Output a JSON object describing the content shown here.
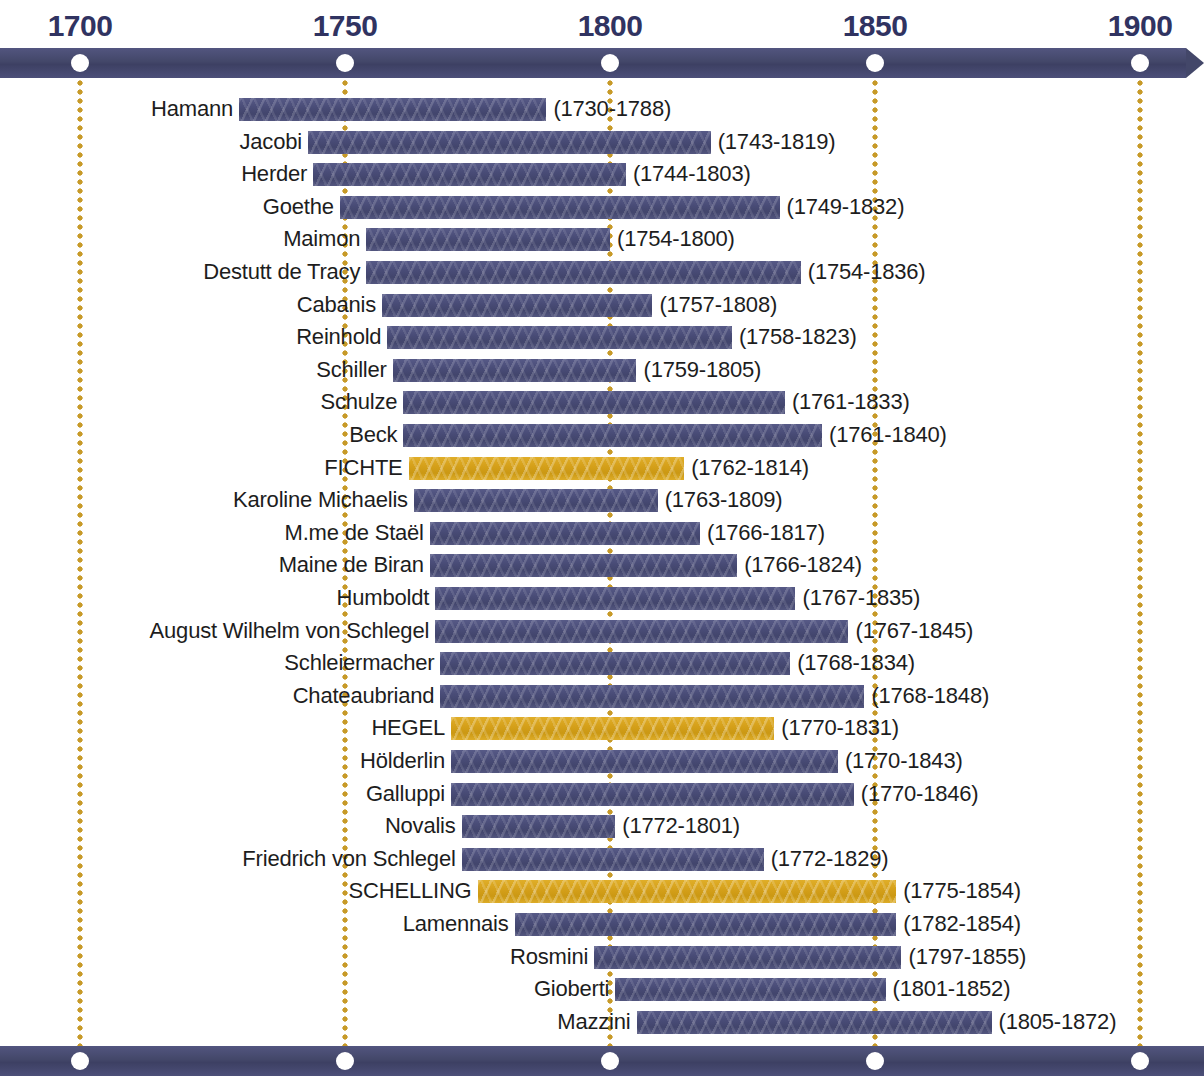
{
  "colors": {
    "bar_navy": "#4A4D78",
    "bar_highlight": "#D8A41E",
    "axis_navy": "#484B78",
    "guide_gold": "#C79A28",
    "year_label": "#303361",
    "text": "#1D1D1D",
    "background": "#FFFFFF"
  },
  "axis": {
    "ticks": [
      {
        "label": "1700",
        "year": 1700
      },
      {
        "label": "1750",
        "year": 1750
      },
      {
        "label": "1800",
        "year": 1800
      },
      {
        "label": "1850",
        "year": 1850
      },
      {
        "label": "1900",
        "year": 1900
      }
    ]
  },
  "chart_data": {
    "type": "bar",
    "title": "",
    "xlabel": "",
    "ylabel": "",
    "xlim": [
      1700,
      1900
    ],
    "grid": true,
    "legend": "none",
    "orientation": "horizontal-gantt",
    "categories": [
      "Hamann",
      "Jacobi",
      "Herder",
      "Goethe",
      "Maimon",
      "Destutt de Tracy",
      "Cabanis",
      "Reinhold",
      "Schiller",
      "Schulze",
      "Beck",
      "FICHTE",
      "Karoline Michaelis",
      "M.me de Staël",
      "Maine de Biran",
      "Humboldt",
      "August Wilhelm von Schlegel",
      "Schleiermacher",
      "Chateaubriand",
      "HEGEL",
      "Hölderlin",
      "Galluppi",
      "Novalis",
      "Friedrich von Schlegel",
      "SCHELLING",
      "Lamennais",
      "Rosmini",
      "Gioberti",
      "Mazzini"
    ],
    "rows": [
      {
        "name": "Hamann",
        "birth": 1730,
        "death": 1788,
        "dates": "(1730-1788)",
        "highlight": false
      },
      {
        "name": "Jacobi",
        "birth": 1743,
        "death": 1819,
        "dates": "(1743-1819)",
        "highlight": false
      },
      {
        "name": "Herder",
        "birth": 1744,
        "death": 1803,
        "dates": "(1744-1803)",
        "highlight": false
      },
      {
        "name": "Goethe",
        "birth": 1749,
        "death": 1832,
        "dates": "(1749-1832)",
        "highlight": false
      },
      {
        "name": "Maimon",
        "birth": 1754,
        "death": 1800,
        "dates": "(1754-1800)",
        "highlight": false
      },
      {
        "name": "Destutt de Tracy",
        "birth": 1754,
        "death": 1836,
        "dates": "(1754-1836)",
        "highlight": false
      },
      {
        "name": "Cabanis",
        "birth": 1757,
        "death": 1808,
        "dates": "(1757-1808)",
        "highlight": false
      },
      {
        "name": "Reinhold",
        "birth": 1758,
        "death": 1823,
        "dates": "(1758-1823)",
        "highlight": false
      },
      {
        "name": "Schiller",
        "birth": 1759,
        "death": 1805,
        "dates": "(1759-1805)",
        "highlight": false
      },
      {
        "name": "Schulze",
        "birth": 1761,
        "death": 1833,
        "dates": "(1761-1833)",
        "highlight": false
      },
      {
        "name": "Beck",
        "birth": 1761,
        "death": 1840,
        "dates": "(1761-1840)",
        "highlight": false
      },
      {
        "name": "FICHTE",
        "birth": 1762,
        "death": 1814,
        "dates": "(1762-1814)",
        "highlight": true
      },
      {
        "name": "Karoline Michaelis",
        "birth": 1763,
        "death": 1809,
        "dates": "(1763-1809)",
        "highlight": false
      },
      {
        "name": "M.me de Staël",
        "birth": 1766,
        "death": 1817,
        "dates": "(1766-1817)",
        "highlight": false
      },
      {
        "name": "Maine de Biran",
        "birth": 1766,
        "death": 1824,
        "dates": "(1766-1824)",
        "highlight": false
      },
      {
        "name": "Humboldt",
        "birth": 1767,
        "death": 1835,
        "dates": "(1767-1835)",
        "highlight": false
      },
      {
        "name": "August Wilhelm von Schlegel",
        "birth": 1767,
        "death": 1845,
        "dates": "(1767-1845)",
        "highlight": false
      },
      {
        "name": "Schleiermacher",
        "birth": 1768,
        "death": 1834,
        "dates": "(1768-1834)",
        "highlight": false
      },
      {
        "name": "Chateaubriand",
        "birth": 1768,
        "death": 1848,
        "dates": "(1768-1848)",
        "highlight": false
      },
      {
        "name": "HEGEL",
        "birth": 1770,
        "death": 1831,
        "dates": "(1770-1831)",
        "highlight": true
      },
      {
        "name": "Hölderlin",
        "birth": 1770,
        "death": 1843,
        "dates": "(1770-1843)",
        "highlight": false
      },
      {
        "name": "Galluppi",
        "birth": 1770,
        "death": 1846,
        "dates": "(1770-1846)",
        "highlight": false
      },
      {
        "name": "Novalis",
        "birth": 1772,
        "death": 1801,
        "dates": "(1772-1801)",
        "highlight": false
      },
      {
        "name": "Friedrich von Schlegel",
        "birth": 1772,
        "death": 1829,
        "dates": "(1772-1829)",
        "highlight": false
      },
      {
        "name": "SCHELLING",
        "birth": 1775,
        "death": 1854,
        "dates": "(1775-1854)",
        "highlight": true
      },
      {
        "name": "Lamennais",
        "birth": 1782,
        "death": 1854,
        "dates": "(1782-1854)",
        "highlight": false
      },
      {
        "name": "Rosmini",
        "birth": 1797,
        "death": 1855,
        "dates": "(1797-1855)",
        "highlight": false
      },
      {
        "name": "Gioberti",
        "birth": 1801,
        "death": 1852,
        "dates": "(1801-1852)",
        "highlight": false
      },
      {
        "name": "Mazzini",
        "birth": 1805,
        "death": 1872,
        "dates": "(1805-1872)",
        "highlight": false
      }
    ]
  }
}
